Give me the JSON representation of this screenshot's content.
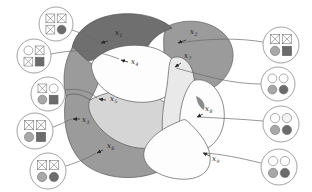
{
  "figure": {
    "kind": "region-partition-diagram",
    "background": "#ffffff",
    "stroke": "#555555",
    "palette": {
      "dark_gray": "#6f6f6f",
      "mid_gray": "#9b9b9b",
      "light_gray": "#d5d5d5",
      "pale_gray": "#e9e9e9",
      "white": "#fdfdfd",
      "icon_dark": "#6b6b6b",
      "icon_mid": "#a8a8a8",
      "icon_open": "#ffffff",
      "label_color": "#1a1a1a"
    }
  },
  "regions": [
    {
      "id": "x1",
      "label": "x",
      "sub": "1",
      "shade": "dark_gray",
      "label_x": 115,
      "label_y": 35,
      "arrow_from_x": 108,
      "arrow_from_y": 41,
      "arrow_to_x": 101,
      "arrow_to_y": 43
    },
    {
      "id": "x2",
      "label": "x",
      "sub": "2",
      "shade": "mid_gray",
      "label_x": 190,
      "label_y": 34,
      "arrow_from_x": 186,
      "arrow_from_y": 40,
      "arrow_to_x": 178,
      "arrow_to_y": 43
    },
    {
      "id": "x3",
      "label": "x",
      "sub": "3",
      "shade": "mid_gray",
      "label_x": 82,
      "label_y": 122,
      "arrow_from_x": 80,
      "arrow_from_y": 119,
      "arrow_to_x": 73,
      "arrow_to_y": 119
    },
    {
      "id": "x4",
      "label": "x",
      "sub": "4",
      "shade": "white",
      "label_x": 131,
      "label_y": 64,
      "arrow_from_x": 128,
      "arrow_from_y": 62,
      "arrow_to_x": 121,
      "arrow_to_y": 60
    },
    {
      "id": "x5",
      "label": "x",
      "sub": "5",
      "shade": "light_gray",
      "label_x": 110,
      "label_y": 101,
      "arrow_from_x": 106,
      "arrow_from_y": 100,
      "arrow_to_x": 99,
      "arrow_to_y": 99
    },
    {
      "id": "x6",
      "label": "x",
      "sub": "6",
      "shade": "mid_gray",
      "label_x": 107,
      "label_y": 148,
      "arrow_from_x": 103,
      "arrow_from_y": 150,
      "arrow_to_x": 97,
      "arrow_to_y": 153
    },
    {
      "id": "x7",
      "label": "x",
      "sub": "7",
      "shade": "pale_gray",
      "label_x": 184,
      "label_y": 58,
      "arrow_from_x": 181,
      "arrow_from_y": 63,
      "arrow_to_x": 175,
      "arrow_to_y": 67
    },
    {
      "id": "x8",
      "label": "x",
      "sub": "8",
      "shade": "white",
      "label_x": 205,
      "label_y": 111,
      "arrow_from_x": 203,
      "arrow_from_y": 114,
      "arrow_to_x": 197,
      "arrow_to_y": 117
    },
    {
      "id": "x9",
      "label": "x",
      "sub": "9",
      "shade": "white",
      "label_x": 212,
      "label_y": 161,
      "arrow_from_x": 210,
      "arrow_from_y": 156,
      "arrow_to_x": 203,
      "arrow_to_y": 153
    }
  ],
  "icons": [
    {
      "id": "icon-1",
      "cx": 56,
      "cy": 24,
      "r": 17,
      "side": "left",
      "cells": [
        "cross",
        "cross",
        "cross",
        "filled-dark-circle"
      ],
      "leader": "M 72 30 C 84 34 92 38 101 43"
    },
    {
      "id": "icon-2",
      "cx": 34,
      "cy": 56,
      "r": 17,
      "side": "left",
      "cells": [
        "open-circle",
        "cross",
        "cross",
        "filled-dark-cross"
      ],
      "leader": "M 51 54 C 72 50 92 48 119 59"
    },
    {
      "id": "icon-3",
      "cx": 48,
      "cy": 94,
      "r": 17,
      "side": "left",
      "cells": [
        "cross",
        "open-circle",
        "filled-mid-circle",
        "filled-dark-square"
      ],
      "leader": "M 64 90 C 76 88 88 90 97 98"
    },
    {
      "id": "icon-4",
      "cx": 35,
      "cy": 131,
      "r": 18,
      "side": "left",
      "cells": [
        "cross",
        "cross",
        "filled-mid-circle",
        "filled-dark-square"
      ],
      "leader": "M 53 127 C 62 124 66 121 72 119"
    },
    {
      "id": "icon-5",
      "cx": 48,
      "cy": 171,
      "r": 18,
      "side": "left",
      "cells": [
        "cross",
        "cross",
        "filled-mid-circle",
        "filled-dark-circle"
      ],
      "leader": "M 66 166 C 78 162 88 158 96 153"
    },
    {
      "id": "icon-6",
      "cx": 281,
      "cy": 45,
      "r": 18,
      "side": "right",
      "cells": [
        "cross",
        "cross",
        "filled-mid-circle",
        "filled-dark-square"
      ],
      "leader": "M 263 42 C 240 38 210 38 179 43"
    },
    {
      "id": "icon-7",
      "cx": 278,
      "cy": 84,
      "r": 17,
      "side": "right",
      "cells": [
        "open-circle",
        "open-circle",
        "filled-mid-circle",
        "filled-dark-circle"
      ],
      "leader": "M 261 84 C 232 84 205 76 176 68"
    },
    {
      "id": "icon-8",
      "cx": 281,
      "cy": 124,
      "r": 18,
      "side": "right",
      "cells": [
        "open-circle",
        "open-light-circle",
        "filled-mid-circle",
        "filled-dark-circle"
      ],
      "leader": "M 263 121 C 240 119 219 118 198 117"
    },
    {
      "id": "icon-9",
      "cx": 279,
      "cy": 167,
      "r": 18,
      "side": "right",
      "cells": [
        "open-circle",
        "open-circle",
        "filled-mid-circle",
        "filled-dark-circle"
      ],
      "leader": "M 261 163 C 240 158 222 154 204 153"
    }
  ]
}
